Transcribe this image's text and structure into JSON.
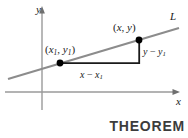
{
  "figure": {
    "name": "point-slope-theorem-figure",
    "background_color": "#ffffff",
    "axis_color": "#9a9a9a",
    "line_color": "#8c8c8c",
    "segment_color": "#1a1a1a",
    "point_color": "#000000",
    "caption_color": "#3c3c3c"
  },
  "axes": {
    "y_label": "y",
    "x_label": "x",
    "origin": {
      "x": 42,
      "y": 92
    }
  },
  "line": {
    "label": "L",
    "start": {
      "x": 8,
      "y": 79
    },
    "end": {
      "x": 179,
      "y": 28
    }
  },
  "points": [
    {
      "id": "point-x1y1",
      "label_parts": {
        "open": "(",
        "x": "x",
        "x_sub": "1",
        "comma": ", ",
        "y": "y",
        "y_sub": "1",
        "close": ")"
      },
      "label_text": "(x1, y1)",
      "coords": {
        "x": 60,
        "y": 63
      }
    },
    {
      "id": "point-xy",
      "label_parts": {
        "open": "(",
        "x": "x",
        "comma": ", ",
        "y": "y",
        "close": ")"
      },
      "label_text": "(x, y)",
      "coords": {
        "x": 139,
        "y": 40
      }
    }
  ],
  "segments": {
    "rise": {
      "label_parts": {
        "y": "y",
        "minus": " − ",
        "y2": "y",
        "sub": "1"
      },
      "label_text": "y − y1",
      "from": {
        "x": 139,
        "y": 40
      },
      "to": {
        "x": 139,
        "y": 63
      }
    },
    "run": {
      "label_parts": {
        "x": "x",
        "minus": " − ",
        "x2": "x",
        "sub": "1"
      },
      "label_text": "x − x1",
      "from": {
        "x": 60,
        "y": 63
      },
      "to": {
        "x": 139,
        "y": 63
      }
    }
  },
  "caption": {
    "text": "THEOREM"
  }
}
